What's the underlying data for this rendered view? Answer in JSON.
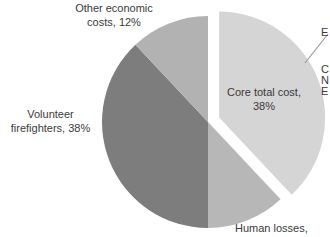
{
  "figure": {
    "background": "#ffffff",
    "text_color": "#3a3a3a",
    "callout_color": "#9a9a9a"
  },
  "chart_data": {
    "type": "pie",
    "title": "",
    "legend": "none",
    "labels_style": "outside-and-inside",
    "slices": [
      {
        "label": "Core total cost",
        "value": 38,
        "color": "#d5d5d5",
        "exploded": true
      },
      {
        "label": "Human losses",
        "value": 12,
        "color": "#b7b7b7",
        "exploded": false
      },
      {
        "label": "Volunteer firefighters",
        "value": 38,
        "color": "#7d7d7d",
        "exploded": false
      },
      {
        "label": "Other economic costs",
        "value": 12,
        "color": "#b2b2b2",
        "exploded": false
      }
    ],
    "start_angle_deg_from_top_clockwise": 0,
    "geometry": {
      "cx": 208,
      "cy": 122,
      "r": 106,
      "explode_px": 12
    }
  },
  "labels": {
    "other_economic": {
      "line1": "Other economic",
      "line2": "costs, 12%"
    },
    "volunteer": {
      "line1": "Volunteer",
      "line2": "firefighters, 38%"
    },
    "core": {
      "line1": "Core total cost,",
      "line2": "38%"
    },
    "human": {
      "text": "Human losses,"
    },
    "clipped_right_top": {
      "line1": "E"
    },
    "clipped_right_block": {
      "line1": "C",
      "line2": "N",
      "line3": "E"
    }
  }
}
